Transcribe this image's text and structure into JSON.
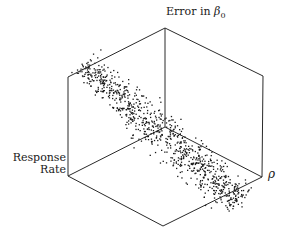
{
  "chart_data": {
    "type": "scatter",
    "subtype": "3d-scatter-cube",
    "title": "",
    "axes": {
      "vertical": "Error in β0",
      "left": "Response Rate",
      "right": "ρ"
    },
    "labels": {
      "top_prefix": "Error in ",
      "top_greek": "β",
      "top_sub": "0",
      "left_line1": "Response",
      "left_line2": "Rate",
      "right": "ρ"
    },
    "grid": false,
    "legend": null,
    "point_count_approx": 900,
    "cloud": {
      "start": [
        85,
        66
      ],
      "end": [
        238,
        200
      ],
      "spread_start": 8,
      "spread_mid": 13,
      "spread_end": 11,
      "density_peak_t": 0.45
    },
    "cube": {
      "top": [
        165,
        28
      ],
      "upper_left": [
        68,
        77
      ],
      "upper_right": [
        263,
        76
      ],
      "lower_left": [
        68,
        176
      ],
      "lower_right": [
        262,
        177
      ],
      "bottom": [
        163,
        226
      ],
      "back": [
        165,
        127
      ]
    },
    "colors": {
      "line": "#2a2a2a",
      "point": "#1a1a1a",
      "background": "#ffffff"
    }
  }
}
